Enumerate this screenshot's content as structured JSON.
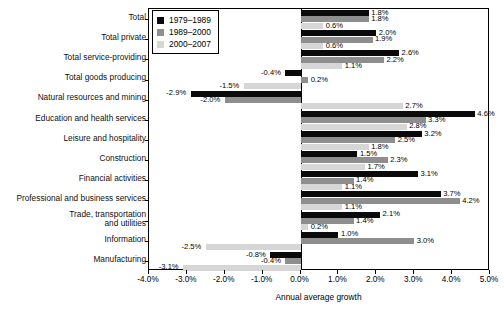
{
  "chart_data": {
    "type": "bar",
    "orientation": "horizontal",
    "title": "",
    "xlabel": "Annual average growth",
    "ylabel": "",
    "xlim": [
      -4.0,
      5.0
    ],
    "xticks": [
      "-4.0%",
      "-3.0%",
      "-2.0%",
      "-1.0%",
      "0.0%",
      "1.0%",
      "2.0%",
      "3.0%",
      "4.0%",
      "5.0%"
    ],
    "xtick_values": [
      -4,
      -3,
      -2,
      -1,
      0,
      1,
      2,
      3,
      4,
      5
    ],
    "grid": false,
    "legend_position": "top-left",
    "categories": [
      "Total",
      "Total private",
      "Total service-providing",
      "Total goods producing",
      "Natural resources and mining",
      "Education and health services",
      "Leisure and hospitality",
      "Construction",
      "Financial activities",
      "Professional and business services",
      "Trade, transportation\nand utilities",
      "Information",
      "Manufacturing"
    ],
    "series": [
      {
        "name": "1979–1989",
        "color": "#0a0a0a",
        "values": [
          1.8,
          2.0,
          2.6,
          -0.4,
          -2.9,
          4.6,
          3.2,
          1.5,
          3.1,
          3.7,
          2.1,
          1.0,
          -0.8
        ],
        "labels": [
          "1.8%",
          "2.0%",
          "2.6%",
          "-0.4%",
          "-2.9%",
          "4.6%",
          "3.2%",
          "1.5%",
          "3.1%",
          "3.7%",
          "2.1%",
          "1.0%",
          "-0.8%"
        ]
      },
      {
        "name": "1989–2000",
        "color": "#8e8e8e",
        "values": [
          1.8,
          1.9,
          2.2,
          0.2,
          -2.0,
          3.3,
          2.5,
          2.3,
          1.4,
          4.2,
          1.4,
          3.0,
          -0.4
        ],
        "labels": [
          "1.8%",
          "1.9%",
          "2.2%",
          "0.2%",
          "-2.0%",
          "3.3%",
          "2.5%",
          "2.3%",
          "1.4%",
          "4.2%",
          "1.4%",
          "3.0%",
          "-0.4%"
        ]
      },
      {
        "name": "2000–2007",
        "color": "#d6d6d6",
        "values": [
          0.6,
          0.6,
          1.1,
          -1.5,
          2.7,
          2.8,
          1.8,
          1.7,
          1.1,
          1.1,
          0.2,
          -2.5,
          -3.1
        ],
        "labels": [
          "0.6%",
          "0.6%",
          "1.1%",
          "-1.5%",
          "2.7%",
          "2.8%",
          "1.8%",
          "1.7%",
          "1.1%",
          "1.1%",
          "0.2%",
          "-2.5%",
          "-3.1%"
        ]
      }
    ]
  }
}
